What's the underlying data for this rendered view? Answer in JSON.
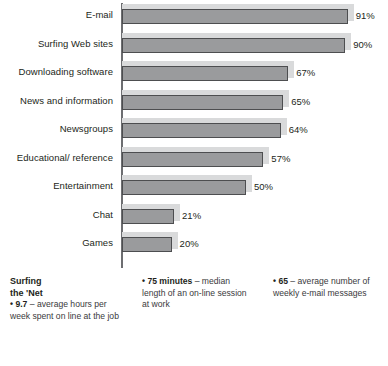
{
  "chart_data": {
    "type": "bar",
    "orientation": "horizontal",
    "title": "",
    "subtitle": "",
    "xlabel": "",
    "ylabel": "",
    "xlim": [
      0,
      100
    ],
    "grid": false,
    "legend": null,
    "value_suffix": "%",
    "categories": [
      "E-mail",
      "Surfing Web sites",
      "Downloading software",
      "News and information",
      "Newsgroups",
      "Educational/ reference",
      "Entertainment",
      "Chat",
      "Games"
    ],
    "values": [
      91,
      90,
      67,
      65,
      64,
      57,
      50,
      21,
      20
    ],
    "value_labels": [
      "91%",
      "90%",
      "67%",
      "65%",
      "64%",
      "57%",
      "50%",
      "21%",
      "20%"
    ],
    "colors": {
      "bar_fill": "#9a9b9d",
      "bar_outline": "#4d4e50",
      "bar_shadow": "#d9dadb",
      "axis": "#6d6e71",
      "text": "#231f20"
    }
  },
  "notes": {
    "heading_line1": "Surfing",
    "heading_line2": "the 'Net",
    "items": [
      {
        "bullet": "•",
        "lead": "9.7",
        "text": " – average hours per week spent on line at the job"
      },
      {
        "bullet": "•",
        "lead": "75 minutes",
        "text": " – median length of an on-line session at work"
      },
      {
        "bullet": "•",
        "lead": "65",
        "text": " – average number of weekly e-mail messages"
      }
    ]
  }
}
